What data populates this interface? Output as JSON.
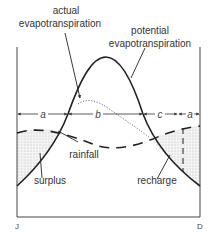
{
  "diagram": {
    "labels": {
      "actual_et": [
        "actual",
        "evapotranspiration"
      ],
      "potential_et": [
        "potential",
        "evapotranspiration"
      ],
      "rainfall": "rainfall",
      "surplus": "surplus",
      "recharge": "recharge"
    },
    "segments": [
      "a",
      "b",
      "c",
      "a"
    ],
    "axis": {
      "start": "J",
      "end": "D"
    },
    "colors": {
      "line": "#222222",
      "stipple": "#888888",
      "background": "#ffffff"
    }
  }
}
